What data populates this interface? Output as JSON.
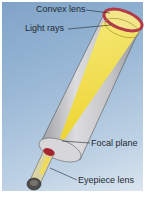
{
  "diagram": {
    "colors": {
      "background": "#9ab8d6",
      "tube": "#c9c9cb",
      "light_beam": "#f2e04a",
      "lens_rim": "#b23a4a",
      "eyepiece": "#5a5856"
    },
    "labels": [
      {
        "id": "convex-lens",
        "text": "Convex lens"
      },
      {
        "id": "light-rays",
        "text": "Light rays"
      },
      {
        "id": "focal-plane",
        "text": "Focal plane"
      },
      {
        "id": "eyepiece-lens",
        "text": "Eyepiece lens"
      }
    ]
  }
}
